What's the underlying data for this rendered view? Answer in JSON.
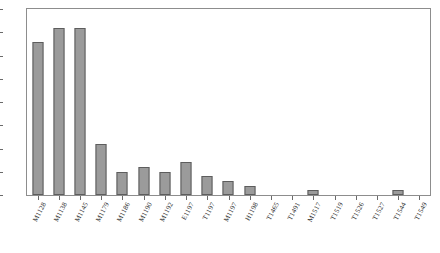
{
  "chart_data": {
    "type": "bar",
    "title": "",
    "subtitle": "",
    "xlabel": "",
    "ylabel": "",
    "ylim": [
      0,
      40
    ],
    "yticks": [
      0,
      5,
      10,
      15,
      20,
      25,
      30,
      35,
      40
    ],
    "grid": false,
    "legend": false,
    "bar_color": "#9b9b9b",
    "bar_edge_color": "#5d5d5d",
    "frame_color": "#8d8d8d",
    "categories": [
      "M1128",
      "M1138",
      "M1145",
      "M1179",
      "M1186",
      "M1190",
      "M1192",
      "E1197",
      "T1197",
      "M1197",
      "H1198",
      "T1465",
      "T1491",
      "M1517",
      "T1519",
      "T1526",
      "T1527",
      "T1544",
      "T1549"
    ],
    "values": [
      33,
      36,
      36,
      11,
      5,
      6,
      5,
      7,
      4,
      3,
      2,
      0,
      0,
      1,
      0,
      0,
      0,
      1,
      0
    ]
  }
}
